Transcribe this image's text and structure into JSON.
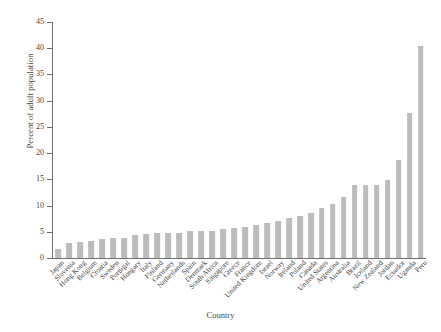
{
  "chart_data": {
    "type": "bar",
    "title": "",
    "xlabel": "Country",
    "ylabel": "Percent of adult population",
    "ylim": [
      0,
      45
    ],
    "yticks": [
      0,
      5,
      10,
      15,
      20,
      25,
      30,
      35,
      40,
      45
    ],
    "grid": false,
    "legend": null,
    "bar_color": "#bcbcbc",
    "axis_color": "#6f6f6f",
    "categories": [
      "Japan",
      "Slovenia",
      "Hong Kong",
      "Belgium",
      "Croatia",
      "Sweden",
      "Portugal",
      "Hungary",
      "Italy",
      "Finland",
      "Germany",
      "Netherlands",
      "Spain",
      "Denmark",
      "South Africa",
      "Singapore",
      "Greece",
      "France",
      "United Kingdom",
      "Israel",
      "Norway",
      "Ireland",
      "Poland",
      "Canada",
      "United States",
      "Argentina",
      "Australia",
      "Brazil",
      "Iceland",
      "New Zealand",
      "Jordan",
      "Ecuador",
      "Uganda",
      "Peru"
    ],
    "values": [
      1.7,
      2.9,
      3.0,
      3.2,
      3.7,
      3.9,
      3.9,
      4.3,
      4.6,
      4.7,
      4.7,
      4.8,
      5.1,
      5.2,
      5.2,
      5.6,
      5.7,
      5.9,
      6.3,
      6.7,
      7.1,
      7.7,
      8.1,
      8.5,
      9.5,
      10.3,
      11.7,
      13.9,
      14.0,
      13.9,
      14.9,
      18.6,
      27.6,
      40.5
    ],
    "extra_values": [
      32.0
    ],
    "value_unit": "percent"
  },
  "axes": {
    "y_title": "Percent of adult population",
    "x_title": "Country",
    "y_tick_labels": [
      "0",
      "5",
      "10",
      "15",
      "20",
      "25",
      "30",
      "35",
      "40",
      "45"
    ]
  }
}
